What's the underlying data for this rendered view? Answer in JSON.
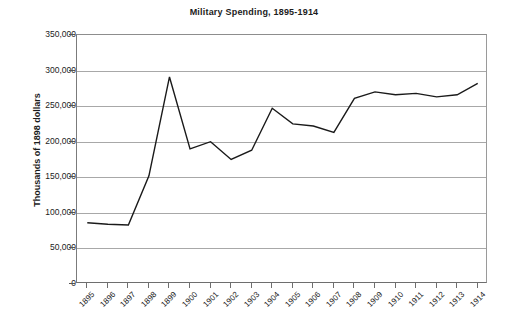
{
  "chart_data": {
    "type": "line",
    "title": "Military Spending, 1895-1914",
    "xlabel": "",
    "ylabel": "Thousands of 1898 dollars",
    "categories": [
      "1895",
      "1896",
      "1897",
      "1898",
      "1899",
      "1900",
      "1901",
      "1902",
      "1903",
      "1904",
      "1905",
      "1906",
      "1907",
      "1908",
      "1909",
      "1910",
      "1911",
      "1912",
      "1913",
      "1914"
    ],
    "x": [
      1895,
      1896,
      1897,
      1898,
      1899,
      1900,
      1901,
      1902,
      1903,
      1904,
      1905,
      1906,
      1907,
      1908,
      1909,
      1910,
      1911,
      1912,
      1913,
      1914
    ],
    "values": [
      86000,
      84000,
      83000,
      152000,
      291000,
      190000,
      200000,
      175000,
      188000,
      247000,
      225000,
      222000,
      213000,
      261000,
      270000,
      266000,
      268000,
      263000,
      266000,
      282000
    ],
    "ylim": [
      0,
      350000
    ],
    "yticks": [
      0,
      50000,
      100000,
      150000,
      200000,
      250000,
      300000,
      350000
    ],
    "ytick_labels": [
      "0",
      "50,000",
      "100,000",
      "150,000",
      "200,000",
      "250,000",
      "300,000",
      "350,000"
    ],
    "grid": true,
    "legend": false,
    "legend_position": "none",
    "series": [
      {
        "name": "Military Spending",
        "color": "#1a1a1a",
        "values": [
          86000,
          84000,
          83000,
          152000,
          291000,
          190000,
          200000,
          175000,
          188000,
          247000,
          225000,
          222000,
          213000,
          261000,
          270000,
          266000,
          268000,
          263000,
          266000,
          282000
        ]
      }
    ]
  },
  "colors": {
    "line": "#1a1a1a",
    "grid": "#a8a8a8",
    "axis": "#6e6e6e",
    "text": "#1c1c1c",
    "background": "#ffffff"
  }
}
